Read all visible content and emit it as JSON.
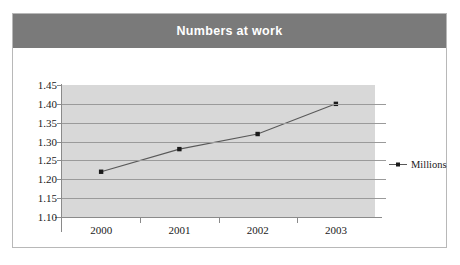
{
  "chart": {
    "title": "Numbers at work",
    "title_bar_color": "#7a7a7a",
    "plot_background_color": "#d8d8d8",
    "series_color": "#595959",
    "frame_border_color": "#b8b8b8"
  },
  "legend": {
    "position": "right",
    "entries": [
      {
        "label": "Millions",
        "marker": "line-with-square-marker"
      }
    ]
  },
  "chart_data": {
    "type": "line",
    "title": "Numbers at work",
    "xlabel": "",
    "ylabel": "",
    "categories": [
      "2000",
      "2001",
      "2002",
      "2003"
    ],
    "x": [
      2000,
      2001,
      2002,
      2003
    ],
    "series": [
      {
        "name": "Millions",
        "values": [
          1.22,
          1.28,
          1.32,
          1.4
        ]
      }
    ],
    "ylim": [
      1.1,
      1.45
    ],
    "ytick_labels": [
      "1.45",
      "1.40",
      "1.35",
      "1.30",
      "1.25",
      "1.20",
      "1.15",
      "1.10"
    ],
    "ytick_values": [
      1.45,
      1.4,
      1.35,
      1.3,
      1.25,
      1.2,
      1.15,
      1.1
    ],
    "ytick_step": 0.05,
    "xtick_labels": [
      "2000",
      "2001",
      "2002",
      "2003"
    ],
    "grid": "horizontal",
    "legend_position": "right",
    "markers": "square"
  }
}
